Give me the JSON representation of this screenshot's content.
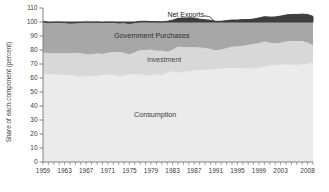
{
  "figure": {
    "ylabel": "Share of each component (percent)",
    "area_labels": {
      "net_exports": "Net Exports",
      "government": "Government Purchases",
      "investment": "Investment",
      "consumption": "Consumption"
    }
  },
  "chart_data": {
    "type": "area",
    "stacked": true,
    "title": "",
    "xlabel": "",
    "ylabel": "Share of each component (percent)",
    "ylim": [
      0,
      110
    ],
    "xlim": [
      1959,
      2009
    ],
    "grid": false,
    "legend_position": "in-plot labels",
    "y_ticks": [
      0,
      10,
      20,
      30,
      40,
      50,
      60,
      70,
      80,
      90,
      100,
      110
    ],
    "x_tick_labels": [
      "1959",
      "1963",
      "1967",
      "1971",
      "1975",
      "1979",
      "1983",
      "1987",
      "1991",
      "1995",
      "1999",
      "2003",
      "2008"
    ],
    "x": [
      1959,
      1960,
      1961,
      1962,
      1963,
      1964,
      1965,
      1966,
      1967,
      1968,
      1969,
      1970,
      1971,
      1972,
      1973,
      1974,
      1975,
      1976,
      1977,
      1978,
      1979,
      1980,
      1981,
      1982,
      1983,
      1984,
      1985,
      1986,
      1987,
      1988,
      1989,
      1990,
      1991,
      1992,
      1993,
      1994,
      1995,
      1996,
      1997,
      1998,
      1999,
      2000,
      2001,
      2002,
      2003,
      2004,
      2005,
      2006,
      2007,
      2008,
      2009
    ],
    "series": [
      {
        "name": "Consumption",
        "color": "#ebebeb",
        "values": [
          62.8,
          62.9,
          62.9,
          62.4,
          62.1,
          62.0,
          61.6,
          60.9,
          61.0,
          61.2,
          61.4,
          62.3,
          62.4,
          62.1,
          61.2,
          61.7,
          62.9,
          62.9,
          62.6,
          61.8,
          61.7,
          62.8,
          61.9,
          63.8,
          64.8,
          63.6,
          64.5,
          64.9,
          65.4,
          65.7,
          65.5,
          65.9,
          66.3,
          66.6,
          66.9,
          66.8,
          67.0,
          67.0,
          66.6,
          66.8,
          67.3,
          68.2,
          68.9,
          69.2,
          69.5,
          69.4,
          69.5,
          69.3,
          69.6,
          70.1,
          70.8
        ]
      },
      {
        "name": "Investment",
        "color": "#d8d8d8",
        "values": [
          15.5,
          15.0,
          14.7,
          15.3,
          15.5,
          15.7,
          16.5,
          16.8,
          15.9,
          15.7,
          16.1,
          14.9,
          15.6,
          16.4,
          17.4,
          16.4,
          13.9,
          15.5,
          17.2,
          18.2,
          18.4,
          16.6,
          17.5,
          14.9,
          15.3,
          18.7,
          17.6,
          17.0,
          16.6,
          16.1,
          16.0,
          14.9,
          13.4,
          13.7,
          14.4,
          15.5,
          15.5,
          16.1,
          16.9,
          17.4,
          17.6,
          17.8,
          16.3,
          15.5,
          15.6,
          16.6,
          17.0,
          17.2,
          16.8,
          15.1,
          12.6
        ]
      },
      {
        "name": "Government Purchases",
        "color": "#a7a7a7",
        "values": [
          22.1,
          21.6,
          22.2,
          22.2,
          22.0,
          21.5,
          21.3,
          22.0,
          23.1,
          22.9,
          22.4,
          22.4,
          21.9,
          21.4,
          20.7,
          21.5,
          22.1,
          21.2,
          20.7,
          20.5,
          20.2,
          20.8,
          20.6,
          21.8,
          21.2,
          20.3,
          20.8,
          21.0,
          20.9,
          20.2,
          20.1,
          20.5,
          20.8,
          20.2,
          19.7,
          19.1,
          18.9,
          18.6,
          18.2,
          17.9,
          18.0,
          17.8,
          18.3,
          18.9,
          19.1,
          19.0,
          18.9,
          18.9,
          19.2,
          20.2,
          20.6
        ]
      },
      {
        "name": "Net Exports",
        "color": "#3d3d3d",
        "values": [
          -0.4,
          0.5,
          0.2,
          0.1,
          0.4,
          0.8,
          0.6,
          0.3,
          0.0,
          0.2,
          0.1,
          0.4,
          0.1,
          0.1,
          0.7,
          0.4,
          1.1,
          0.4,
          -0.5,
          -0.5,
          -0.3,
          -0.2,
          0.0,
          -0.5,
          -1.3,
          -2.6,
          -2.9,
          -2.9,
          -2.9,
          -2.0,
          -1.6,
          -1.3,
          -0.5,
          -0.5,
          -1.0,
          -1.4,
          -1.4,
          -1.7,
          -1.7,
          -2.1,
          -2.9,
          -3.8,
          -3.5,
          -3.6,
          -4.2,
          -5.0,
          -5.4,
          -5.4,
          -5.6,
          -5.4,
          -4.0
        ]
      }
    ],
    "note_on_rendering": "Net Exports is drawn as the dark band above the 100 line (magnitude of negative net exports); Consumption, Investment and Government Purchases are stacked from 0.",
    "colors": {
      "axis": "#808080",
      "tick_text": "#3a3a3a"
    }
  }
}
